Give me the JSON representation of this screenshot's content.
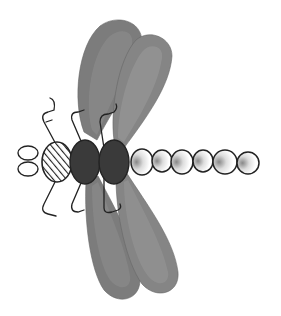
{
  "figure": {
    "subject": "dragonfly-icon",
    "colors": {
      "background": "#ffffff",
      "wing_dark": "#6e6e6e",
      "wing_mid": "#858585",
      "wing_light": "#9a9a9a",
      "thorax": "#3a3a3a",
      "outline": "#222222",
      "abdomen_fill": "#ffffff"
    },
    "parts": {
      "head": "eyes",
      "neck": "hatched-segment",
      "thorax": [
        "thorax-segment-1",
        "thorax-segment-2"
      ],
      "abdomen_segment_count": 6,
      "wings": [
        "upper-front-wing",
        "upper-rear-wing",
        "lower-front-wing",
        "lower-rear-wing"
      ],
      "legs": [
        "leg-upper-1",
        "leg-upper-2",
        "leg-upper-3",
        "leg-lower-1",
        "leg-lower-2",
        "leg-lower-3"
      ]
    }
  }
}
